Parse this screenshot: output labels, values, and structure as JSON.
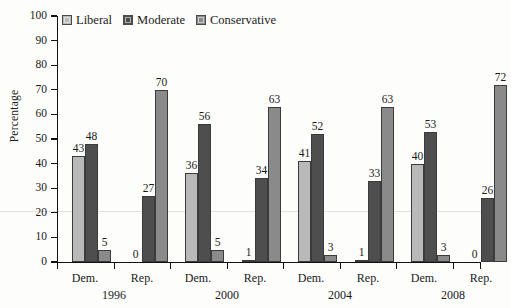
{
  "chart_data": {
    "type": "bar",
    "title": "",
    "xlabel": "",
    "ylabel": "Percentage",
    "ylim": [
      0,
      100
    ],
    "ytick_step": 10,
    "yticks": [
      0,
      10,
      20,
      30,
      40,
      50,
      60,
      70,
      80,
      90,
      100
    ],
    "grid": false,
    "legend_position": "top-left",
    "legend": [
      "Liberal",
      "Moderate",
      "Conservative"
    ],
    "colors": {
      "liberal": "#b9b9b9",
      "moderate": "#4e4e4e",
      "conservative": "#8a8a8a",
      "axis": "#111111"
    },
    "groups": [
      "1996",
      "2000",
      "2004",
      "2008"
    ],
    "subgroups": [
      "Dem.",
      "Rep."
    ],
    "categories": [
      "Dem. 1996",
      "Rep. 1996",
      "Dem. 2000",
      "Rep. 2000",
      "Dem. 2004",
      "Rep. 2004",
      "Dem. 2008",
      "Rep. 2008"
    ],
    "series": [
      {
        "name": "Liberal",
        "values": [
          43,
          0,
          36,
          1,
          41,
          1,
          40,
          0
        ]
      },
      {
        "name": "Moderate",
        "values": [
          48,
          27,
          56,
          34,
          52,
          33,
          53,
          26
        ]
      },
      {
        "name": "Conservative",
        "values": [
          5,
          70,
          5,
          63,
          3,
          63,
          3,
          72
        ]
      }
    ]
  },
  "axis": {
    "y_title": "Percentage"
  },
  "xlabels": {
    "dem": "Dem.",
    "rep": "Rep.",
    "years": [
      "1996",
      "2000",
      "2004",
      "2008"
    ]
  }
}
